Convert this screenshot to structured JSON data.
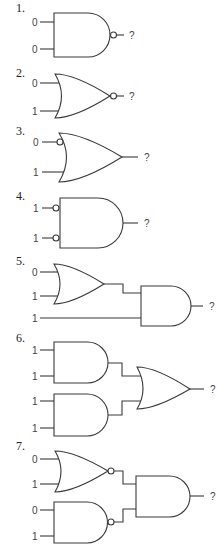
{
  "problems": [
    {
      "number": "1.",
      "type": "NAND",
      "inputs": [
        "0",
        "0"
      ],
      "output": "?"
    },
    {
      "number": "2.",
      "type": "NOR",
      "inputs": [
        "0",
        "1"
      ],
      "output": "?"
    },
    {
      "number": "3.",
      "type": "OR with inverted first input",
      "inputs": [
        "0",
        "1"
      ],
      "output": "?"
    },
    {
      "number": "4.",
      "type": "AND with both inputs inverted",
      "inputs": [
        "1",
        "1"
      ],
      "output": "?"
    },
    {
      "number": "5.",
      "type": "OR feeding AND",
      "inputs": [
        "0",
        "1",
        "1"
      ],
      "output": "?"
    },
    {
      "number": "6.",
      "type": "two ANDs feeding OR",
      "inputs": [
        "1",
        "1",
        "1",
        "1"
      ],
      "output": "?"
    },
    {
      "number": "7.",
      "type": "NOR and NAND feeding AND",
      "inputs": [
        "0",
        "1",
        "0",
        "1"
      ],
      "output": "?"
    }
  ],
  "colors": {
    "line": "#3a3a3a",
    "background": "#ffffff"
  }
}
